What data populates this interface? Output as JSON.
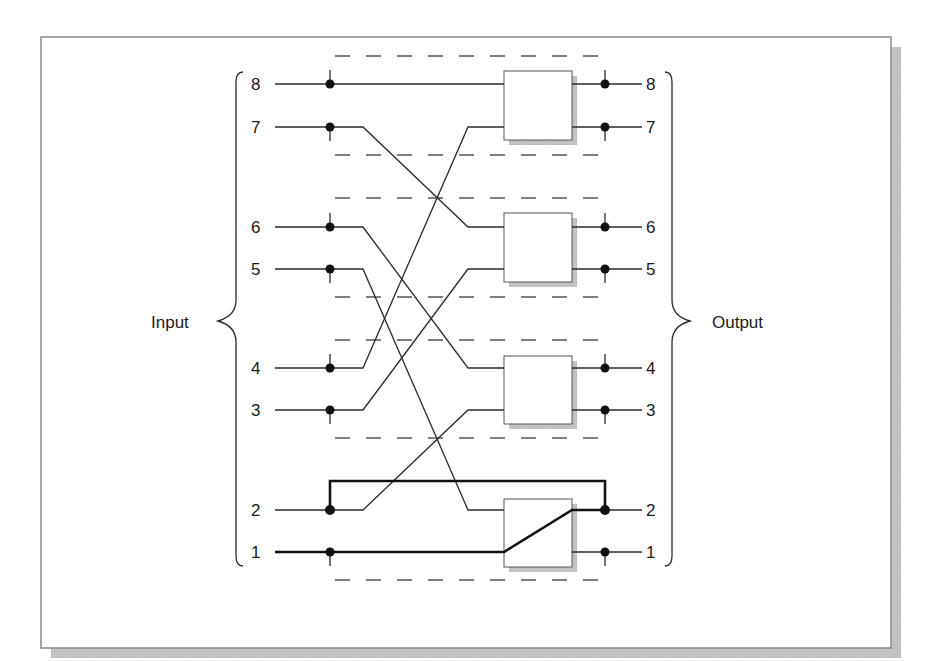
{
  "diagram": {
    "input_label": "Input",
    "output_label": "Output",
    "input_ports": [
      "8",
      "7",
      "6",
      "5",
      "4",
      "3",
      "2",
      "1"
    ],
    "output_ports": [
      "8",
      "7",
      "6",
      "5",
      "4",
      "3",
      "2",
      "1"
    ],
    "switch_boxes": [
      {
        "id": "switch-1",
        "inputs": [
          "8",
          "4"
        ],
        "outputs": [
          "8",
          "7"
        ]
      },
      {
        "id": "switch-2",
        "inputs": [
          "7",
          "3"
        ],
        "outputs": [
          "6",
          "5"
        ]
      },
      {
        "id": "switch-3",
        "inputs": [
          "6",
          "2"
        ],
        "outputs": [
          "4",
          "3"
        ]
      },
      {
        "id": "switch-4",
        "inputs": [
          "5",
          "1"
        ],
        "outputs": [
          "2",
          "1"
        ],
        "internal_path": "1 -> 2 (bold)"
      }
    ],
    "bold_paths": [
      "input 1 -> switch-4 -> output 2",
      "input 2 bypass -> output 2"
    ],
    "colors": {
      "line": "#2a2a2a",
      "dash": "#555555",
      "frame": "#888888",
      "shadow": "#c8c8c8",
      "box_fill": "#ffffff",
      "dot": "#111111"
    }
  }
}
